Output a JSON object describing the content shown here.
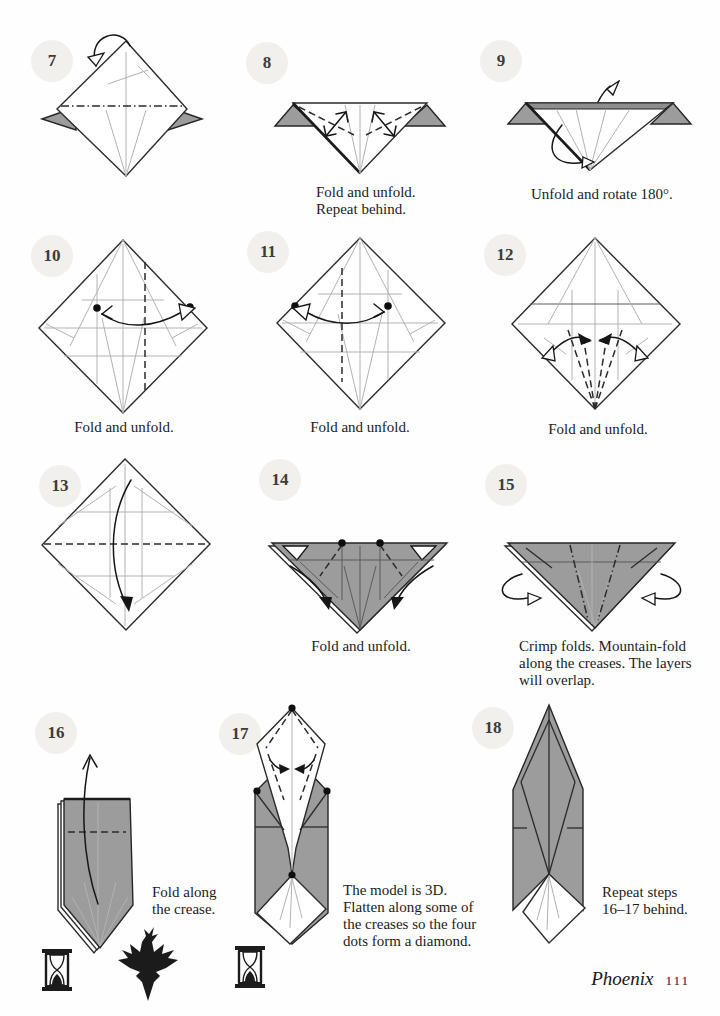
{
  "page": {
    "footer": {
      "model_name": "Phoenix",
      "page_number": "111"
    }
  },
  "colors": {
    "paper_gray": "#9c9c9c",
    "badge_background": "#f1f0ec",
    "outline": "#2b2b2b",
    "crease_light": "#b2b2b2",
    "text": "#1c1c1c"
  },
  "icons": {
    "hourglass": "hourglass-icon",
    "phoenix_silhouette": "phoenix-icon"
  },
  "steps": {
    "s7": {
      "number": "7",
      "caption": ""
    },
    "s8": {
      "number": "8",
      "caption": "Fold and unfold.\nRepeat behind."
    },
    "s9": {
      "number": "9",
      "caption": "Unfold and rotate 180°."
    },
    "s10": {
      "number": "10",
      "caption": "Fold and unfold."
    },
    "s11": {
      "number": "11",
      "caption": "Fold and unfold."
    },
    "s12": {
      "number": "12",
      "caption": "Fold and unfold."
    },
    "s13": {
      "number": "13",
      "caption": ""
    },
    "s14": {
      "number": "14",
      "caption": "Fold and unfold."
    },
    "s15": {
      "number": "15",
      "caption": "Crimp folds. Mountain-fold\nalong the creases. The layers\nwill overlap."
    },
    "s16": {
      "number": "16",
      "caption": "Fold along\nthe crease."
    },
    "s17": {
      "number": "17",
      "caption": "The model is 3D.\nFlatten along some of\nthe creases so the four\ndots form a diamond."
    },
    "s18": {
      "number": "18",
      "caption": "Repeat steps\n16–17 behind."
    }
  }
}
